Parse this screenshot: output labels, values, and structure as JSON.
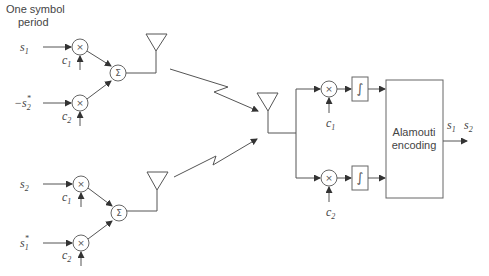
{
  "title_label": [
    "One symbol",
    "period"
  ],
  "colors": {
    "line": "#555555",
    "text": "#444444",
    "background": "#ffffff"
  },
  "transmitters": [
    {
      "inputs": [
        {
          "symbol": "s",
          "sub": "1",
          "prefix": "",
          "sup": "",
          "code": "c",
          "code_sub": "1"
        },
        {
          "symbol": "s",
          "sub": "2",
          "prefix": "−",
          "sup": "*",
          "code": "c",
          "code_sub": "2"
        }
      ],
      "sum_glyph": "Σ",
      "mult_glyph": "×"
    },
    {
      "inputs": [
        {
          "symbol": "s",
          "sub": "2",
          "prefix": "",
          "sup": "",
          "code": "c",
          "code_sub": "1"
        },
        {
          "symbol": "s",
          "sub": "1",
          "prefix": "",
          "sup": "*",
          "code": "c",
          "code_sub": "2"
        }
      ],
      "sum_glyph": "Σ",
      "mult_glyph": "×"
    }
  ],
  "receiver": {
    "branches": [
      {
        "code": "c",
        "code_sub": "1",
        "integrator_glyph": "∫"
      },
      {
        "code": "c",
        "code_sub": "2",
        "integrator_glyph": "∫"
      }
    ],
    "block_label": [
      "Alamouti",
      "encoding"
    ],
    "outputs": [
      {
        "symbol": "s",
        "sub": "1"
      },
      {
        "symbol": "s",
        "sub": "2"
      }
    ]
  }
}
